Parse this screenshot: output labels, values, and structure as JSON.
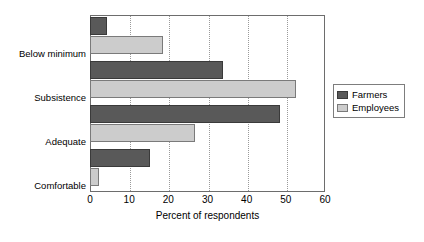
{
  "chart_data": {
    "type": "bar",
    "orientation": "horizontal",
    "title": "",
    "xlabel": "Percent of respondents",
    "ylabel": "",
    "xlim": [
      0,
      60
    ],
    "xticks": [
      0,
      10,
      20,
      30,
      40,
      50,
      60
    ],
    "grid": "vertical-dotted",
    "legend_position": "right",
    "categories": [
      "Below minimum",
      "Subsistence",
      "Adequate",
      "Comfortable"
    ],
    "series": [
      {
        "name": "Farmers",
        "color": "#595959",
        "values": [
          4.3,
          34.0,
          48.5,
          15.3
        ]
      },
      {
        "name": "Employees",
        "color": "#cccccc",
        "values": [
          18.6,
          52.6,
          26.8,
          2.3
        ]
      }
    ]
  },
  "axis": {
    "tick_labels": [
      "0",
      "10",
      "20",
      "30",
      "40",
      "50",
      "60"
    ],
    "x_title": "Percent of respondents"
  },
  "categories": [
    {
      "label": "Below minimum"
    },
    {
      "label": "Subsistence"
    },
    {
      "label": "Adequate"
    },
    {
      "label": "Comfortable"
    }
  ],
  "legend": {
    "entries": [
      {
        "label": "Farmers"
      },
      {
        "label": "Employees"
      }
    ]
  }
}
